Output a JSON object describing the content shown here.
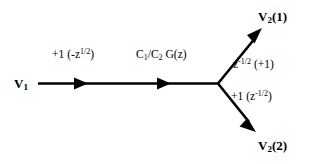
{
  "diagram": {
    "type": "signal-flow-graph",
    "background_color": "#ffffff",
    "stroke_color": "#000000",
    "nodes": [
      {
        "id": "v1",
        "label_plain": "V1",
        "base": "V",
        "subscript": "1",
        "x": 14,
        "y": 77
      },
      {
        "id": "v21",
        "label_plain": "V2(1)",
        "base": "V",
        "subscript": "2",
        "suffix": "(1)",
        "x": 258,
        "y": 10
      },
      {
        "id": "v22",
        "label_plain": "V2(2)",
        "base": "V",
        "subscript": "2",
        "suffix": "(2)",
        "x": 258,
        "y": 139
      }
    ],
    "edges": [
      {
        "id": "input-branch",
        "from": "v1",
        "to": "junction",
        "direction": "right",
        "label_plain": "+1 (-z^1/2)",
        "label_parts": {
          "gain": "+1",
          "open": "(-z",
          "exponent": "1/2",
          "close": ")"
        }
      },
      {
        "id": "filter-branch",
        "from": "v1",
        "to": "junction",
        "direction": "right",
        "label_plain": "C1/C2 G(z)",
        "label_parts": {
          "c1": "C",
          "c1sub": "1",
          "slash": "/",
          "c2": "C",
          "c2sub": "2",
          "gain": "G(z)"
        }
      },
      {
        "id": "upper-branch",
        "from": "junction",
        "to": "v21",
        "direction": "up-right",
        "label_plain": "z^-1/2 (+1)",
        "label_parts": {
          "base": "z",
          "exponent": "-1/2",
          "paren": "(+1)"
        }
      },
      {
        "id": "lower-branch",
        "from": "junction",
        "to": "v22",
        "direction": "down-right",
        "label_plain": "+1 (z^-1/2)",
        "label_parts": {
          "gain": "+1",
          "open": "(z",
          "exponent": "-1/2",
          "close": ")"
        }
      }
    ],
    "junction": {
      "x": 218,
      "y": 83
    }
  }
}
